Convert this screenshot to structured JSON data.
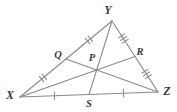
{
  "figure": {
    "kind": "triangle-with-medians",
    "caption": "Triangle XYZ with medians XR, YS, ZQ meeting at centroid P",
    "stroke_color": "#8a8a8a",
    "label_color": "#3a3a3a",
    "background_color": "#ffffff",
    "vertices": [
      {
        "id": "X",
        "label": "X",
        "x": 20,
        "y": 97,
        "label_x": 8,
        "label_y": 98
      },
      {
        "id": "Y",
        "label": "Y",
        "x": 112,
        "y": 21,
        "label_x": 108,
        "label_y": 14
      },
      {
        "id": "Z",
        "label": "Z",
        "x": 158,
        "y": 92,
        "label_x": 163,
        "label_y": 95
      }
    ],
    "midpoints": [
      {
        "id": "Q",
        "label": "Q",
        "on_segment": "XY",
        "x": 66,
        "y": 59,
        "label_x": 54,
        "label_y": 57
      },
      {
        "id": "R",
        "label": "R",
        "on_segment": "YZ",
        "x": 135,
        "y": 56.5,
        "label_x": 138,
        "label_y": 54
      },
      {
        "id": "S",
        "label": "S",
        "on_segment": "XZ",
        "x": 89,
        "y": 94.5,
        "label_x": 85,
        "label_y": 107
      }
    ],
    "centroid": {
      "id": "P",
      "label": "P",
      "x": 97,
      "y": 64,
      "label_x": 88,
      "label_y": 60
    },
    "sides": [
      {
        "id": "XY",
        "from": "X",
        "to": "Y"
      },
      {
        "id": "YZ",
        "from": "Y",
        "to": "Z"
      },
      {
        "id": "XZ",
        "from": "X",
        "to": "Z"
      }
    ],
    "medians": [
      {
        "id": "XR",
        "from": "X",
        "to": "R"
      },
      {
        "id": "YS",
        "from": "Y",
        "to": "S"
      },
      {
        "id": "ZQ",
        "from": "Z",
        "to": "Q"
      }
    ],
    "tick_marks": [
      {
        "id": "tick-XQ",
        "segment": "XQ",
        "count": 2,
        "x": 43,
        "y": 78
      },
      {
        "id": "tick-QY",
        "segment": "QY",
        "count": 2,
        "x": 89,
        "y": 40
      },
      {
        "id": "tick-YR",
        "segment": "YR",
        "count": 3,
        "x": 123.5,
        "y": 38.5
      },
      {
        "id": "tick-RZ",
        "segment": "RZ",
        "count": 3,
        "x": 146.5,
        "y": 74
      },
      {
        "id": "tick-XS",
        "segment": "XS",
        "count": 1,
        "x": 54.5,
        "y": 95.7
      },
      {
        "id": "tick-SZ",
        "segment": "SZ",
        "count": 1,
        "x": 123.5,
        "y": 93.3
      }
    ]
  }
}
